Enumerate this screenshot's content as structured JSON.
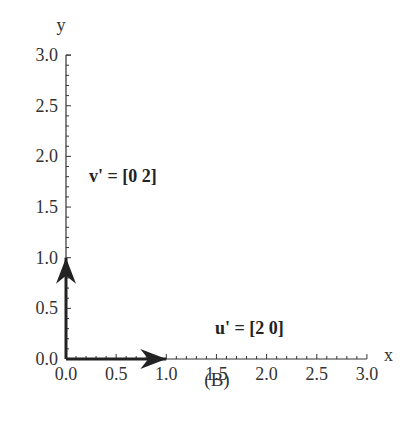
{
  "chart_data": {
    "type": "vector-plot",
    "title": "",
    "caption": "(B)",
    "xlabel": "x",
    "ylabel": "y",
    "xlim": [
      0,
      3
    ],
    "ylim": [
      0,
      3
    ],
    "xticks": [
      "0.0",
      "0.5",
      "1.0",
      "1.5",
      "2.0",
      "2.5",
      "3.0"
    ],
    "yticks": [
      "0.0",
      "0.5",
      "1.0",
      "1.5",
      "2.0",
      "2.5",
      "3.0"
    ],
    "minor_tick_step": 0.1,
    "grid": false,
    "series": [
      {
        "name": "u'",
        "label": "u' = [2  0]",
        "start": [
          0,
          0
        ],
        "end": [
          1,
          0
        ],
        "components": [
          2,
          0
        ],
        "label_pos": [
          1.5,
          0.3
        ]
      },
      {
        "name": "v'",
        "label": "v' = [0  2]",
        "start": [
          0,
          0
        ],
        "end": [
          0,
          1
        ],
        "components": [
          0,
          2
        ],
        "label_pos": [
          0.25,
          1.83
        ]
      }
    ]
  },
  "labels": {
    "u": "u' = [2  0]",
    "v": "v' = [0  2]",
    "caption": "(B)",
    "xaxis": "x",
    "yaxis": "y"
  }
}
